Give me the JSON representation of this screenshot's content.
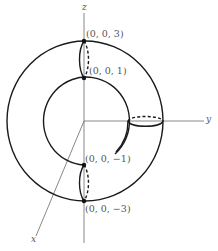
{
  "figure": {
    "axes": {
      "z_label": "z",
      "y_label": "y",
      "x_label": "x"
    },
    "points": [
      {
        "label": "(0, 0, 3)"
      },
      {
        "label": "(0, 0, 1)"
      },
      {
        "label": "(0, 0, −1)"
      },
      {
        "label": "(0, 0, −3)"
      }
    ],
    "colors": {
      "curve": "#1a1a1a",
      "axis": "#6a6a6a",
      "label": "#555555"
    }
  }
}
